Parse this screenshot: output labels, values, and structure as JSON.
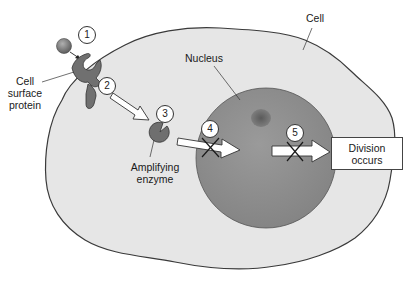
{
  "diagram": {
    "labels": {
      "cell": "Cell",
      "nucleus": "Nucleus",
      "cell_surface_protein": [
        "Cell",
        "surface",
        "protein"
      ],
      "amplifying_enzyme": [
        "Amplifying",
        "enzyme"
      ],
      "division_occurs": [
        "Division",
        "occurs"
      ]
    },
    "steps": [
      {
        "number": "1",
        "meaning": "signal molecule binds receptor"
      },
      {
        "number": "2",
        "meaning": "signal relayed"
      },
      {
        "number": "3",
        "meaning": "amplifying enzyme"
      },
      {
        "number": "4",
        "meaning": "signal to nucleus blocked"
      },
      {
        "number": "5",
        "meaning": "division signal blocked"
      }
    ],
    "blocked_steps": [
      "4",
      "5"
    ],
    "colors": {
      "cytoplasm": "#e6e6e6",
      "cell_outline": "#3a3a3a",
      "nucleus": "#8f8f8f",
      "nucleolus": "#6a6a6a",
      "protein": "#6f6f6f",
      "signal_molecule": "#7a7a7a",
      "arrow_fill": "#ffffff",
      "cross": "#1a1a1a"
    }
  }
}
